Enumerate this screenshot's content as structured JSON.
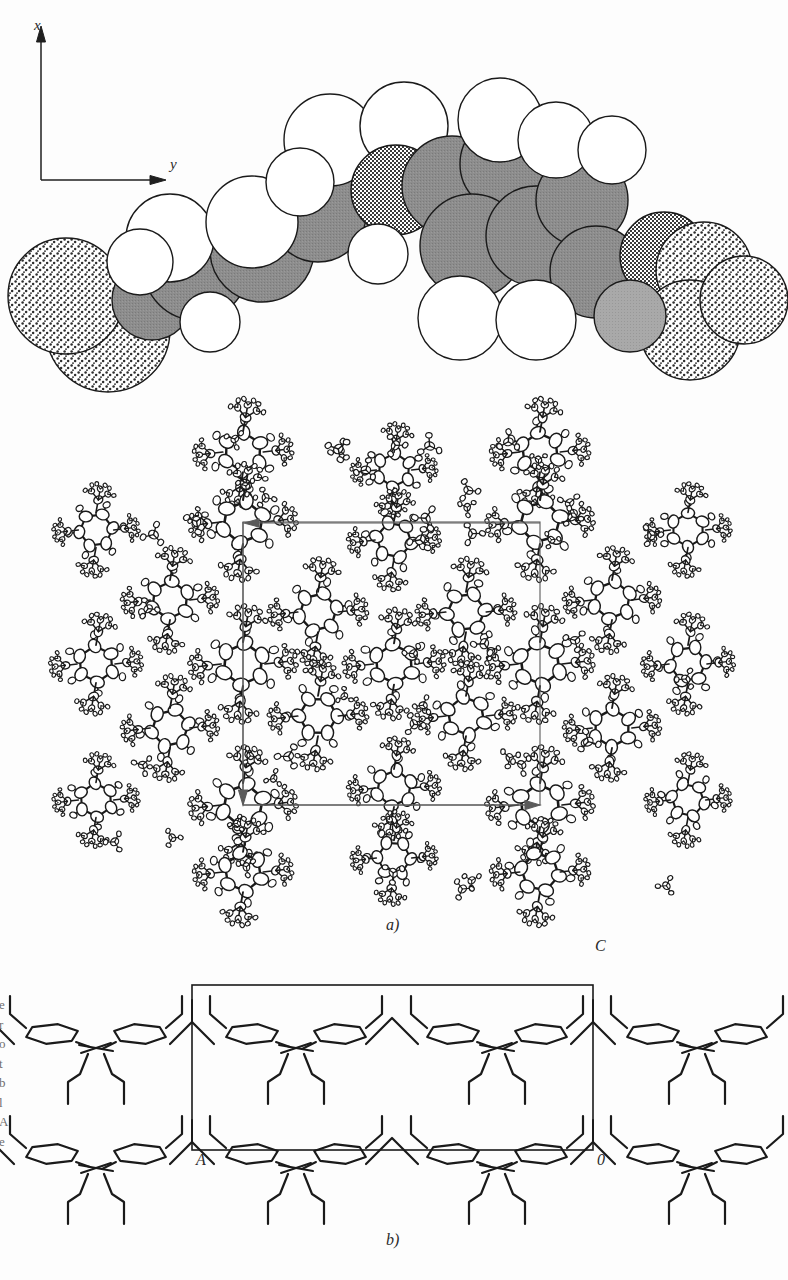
{
  "figure": {
    "background_color": "#fdfdfd",
    "ink_color": "#1a1a1a",
    "panels": [
      {
        "id": "top",
        "label": "",
        "kind": "space-filling-model"
      },
      {
        "id": "middle",
        "label": "a)",
        "kind": "ortep-packing-diagram"
      },
      {
        "id": "bottom",
        "label": "b)",
        "kind": "line-skeleton-packing"
      }
    ]
  },
  "axes": {
    "x_label": "x",
    "y_label": "y",
    "origin": {
      "x": 41,
      "y": 180
    },
    "x_tip": {
      "x": 41,
      "y": 30
    },
    "y_tip": {
      "x": 165,
      "y": 180
    }
  },
  "panel_a": {
    "label": "a)",
    "caption": "",
    "cell": {
      "left": 243,
      "top": 522,
      "right": 540,
      "bottom": 805
    },
    "representation": "thermal ellipsoids"
  },
  "panel_b": {
    "label": "b)",
    "cell_corners": {
      "top_right": "C",
      "bottom_left": "A",
      "bottom_right": "0"
    },
    "cell": {
      "left": 192,
      "top": 985,
      "right": 593,
      "bottom": 1150
    }
  },
  "margin_text": [
    "e",
    "r",
    "o",
    "t",
    "b",
    "l",
    "A",
    "e"
  ],
  "model": {
    "sphere_styles": [
      {
        "name": "hydrogen",
        "fill": "#ffffff",
        "pattern": "none"
      },
      {
        "name": "carbon",
        "fill": "#8a8a8a",
        "pattern": "solid-gray"
      },
      {
        "name": "heteroatom",
        "fill": "#efefef",
        "pattern": "fine-checker"
      },
      {
        "name": "terminal",
        "fill": "#f2f2f2",
        "pattern": "coarse-dots"
      }
    ]
  }
}
